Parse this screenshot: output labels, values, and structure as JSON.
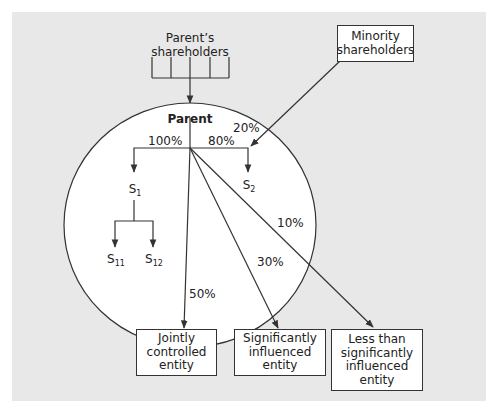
{
  "figure": {
    "nodes": {
      "parents_shareholders": [
        "Parent’s",
        "shareholders"
      ],
      "minority_shareholders": [
        "Minority",
        "shareholders"
      ],
      "parent": "Parent",
      "s1": {
        "base": "S",
        "sub": "1"
      },
      "s2": {
        "base": "S",
        "sub": "2"
      },
      "s11": {
        "base": "S",
        "sub": "11"
      },
      "s12": {
        "base": "S",
        "sub": "12"
      },
      "jointly_controlled": [
        "Jointly",
        "controlled",
        "entity"
      ],
      "significantly_influenced": [
        "Significantly",
        "influenced",
        "entity"
      ],
      "less_than_significant": [
        "Less than",
        "significantly",
        "influenced",
        "entity"
      ]
    },
    "edges": {
      "parent_to_s1": "100%",
      "parent_to_s2": "80%",
      "minority_to_s2": "20%",
      "parent_to_less_than_significant": "10%",
      "parent_to_significantly_influenced": "30%",
      "parent_to_jointly_controlled": "50%"
    },
    "colors": {
      "panel_background": "#e8e8e8",
      "group_circle": "#ffffff",
      "line": "#333333"
    }
  }
}
